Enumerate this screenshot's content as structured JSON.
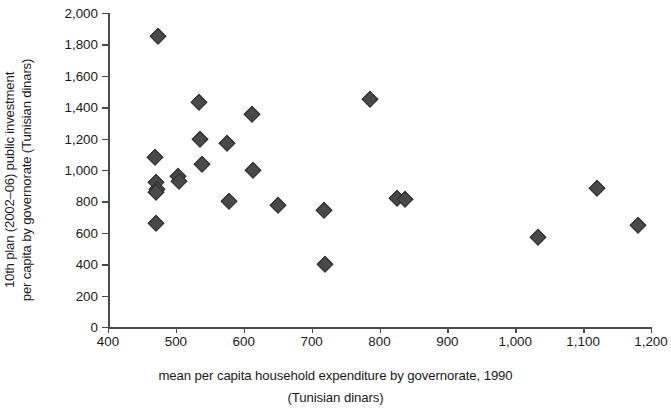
{
  "chart_data": {
    "type": "scatter",
    "title": "",
    "xlabel": "mean per capita household expenditure by governorate, 1990",
    "xlabel_line2": "(Tunisian dinars)",
    "ylabel_line1": "10th plan (2002–06) public investment",
    "ylabel_line2": "per capita by governorate (Tunisian dinars)",
    "xlim": [
      400,
      1200
    ],
    "ylim": [
      0,
      2000
    ],
    "xticks": [
      400,
      500,
      600,
      700,
      800,
      900,
      1000,
      1100,
      1200
    ],
    "xtick_labels": [
      "400",
      "500",
      "600",
      "700",
      "800",
      "900",
      "1,000",
      "1,100",
      "1,200"
    ],
    "yticks": [
      0,
      200,
      400,
      600,
      800,
      1000,
      1200,
      1400,
      1600,
      1800,
      2000
    ],
    "ytick_labels": [
      "0",
      "200",
      "400",
      "600",
      "800",
      "1,000",
      "1,200",
      "1,400",
      "1,600",
      "1,800",
      "2,000"
    ],
    "grid": false,
    "legend": null,
    "marker": "diamond",
    "marker_color": "#494949",
    "marker_edge_color": "#2e2e2e",
    "axis_color": "#4a4a4a",
    "points": [
      {
        "x": 474,
        "y": 1855
      },
      {
        "x": 469,
        "y": 1085
      },
      {
        "x": 470,
        "y": 925
      },
      {
        "x": 472,
        "y": 880
      },
      {
        "x": 471,
        "y": 860
      },
      {
        "x": 470,
        "y": 660
      },
      {
        "x": 503,
        "y": 960
      },
      {
        "x": 505,
        "y": 930
      },
      {
        "x": 534,
        "y": 1430
      },
      {
        "x": 536,
        "y": 1195
      },
      {
        "x": 538,
        "y": 1040
      },
      {
        "x": 575,
        "y": 1170
      },
      {
        "x": 578,
        "y": 800
      },
      {
        "x": 612,
        "y": 1355
      },
      {
        "x": 614,
        "y": 1000
      },
      {
        "x": 651,
        "y": 775
      },
      {
        "x": 718,
        "y": 745
      },
      {
        "x": 719,
        "y": 400
      },
      {
        "x": 786,
        "y": 1455
      },
      {
        "x": 826,
        "y": 820
      },
      {
        "x": 838,
        "y": 815
      },
      {
        "x": 1034,
        "y": 575
      },
      {
        "x": 1121,
        "y": 885
      },
      {
        "x": 1181,
        "y": 650
      }
    ]
  }
}
